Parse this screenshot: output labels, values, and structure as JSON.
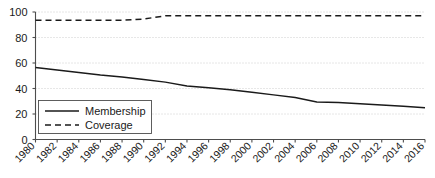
{
  "chart_data": {
    "type": "line",
    "title": "",
    "subtitle": "",
    "xlabel": "",
    "ylabel": "",
    "xlim": [
      1980,
      2016
    ],
    "ylim": [
      0,
      100
    ],
    "grid": true,
    "legend_position": "bottom-left",
    "categories": [
      1980,
      1982,
      1984,
      1986,
      1988,
      1990,
      1992,
      1994,
      1996,
      1998,
      2000,
      2002,
      2004,
      2006,
      2008,
      2010,
      2012,
      2014,
      2016
    ],
    "xticks": [
      "1980",
      "1982",
      "1984",
      "1986",
      "1988",
      "1990",
      "1992",
      "1994",
      "1996",
      "1998",
      "2000",
      "2002",
      "2004",
      "2006",
      "2008",
      "2010",
      "2012",
      "2014",
      "2016"
    ],
    "yticks": [
      "0",
      "20",
      "40",
      "60",
      "80",
      "100"
    ],
    "series": [
      {
        "name": "Membership",
        "style": "solid",
        "color": "#1a1a1a",
        "values": [
          56.5,
          54.5,
          52.5,
          50.5,
          49.0,
          47.0,
          45.0,
          42.0,
          40.5,
          39.0,
          37.0,
          35.0,
          33.0,
          29.5,
          29.0,
          28.0,
          27.0,
          26.0,
          25.0
        ]
      },
      {
        "name": "Coverage",
        "style": "dashed",
        "color": "#1a1a1a",
        "values": [
          93.5,
          93.5,
          93.5,
          93.5,
          93.5,
          94.5,
          97.0,
          97.0,
          97.0,
          97.0,
          97.0,
          97.0,
          97.0,
          97.0,
          97.0,
          97.0,
          97.0,
          97.0,
          97.0
        ]
      }
    ],
    "legend": [
      {
        "label": "Membership",
        "style": "solid"
      },
      {
        "label": "Coverage",
        "style": "dashed"
      }
    ]
  }
}
